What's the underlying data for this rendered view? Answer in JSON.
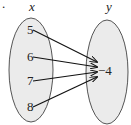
{
  "diagram": {
    "type": "mapping",
    "domain_label": "x",
    "range_label": "y",
    "domain_values": [
      "5",
      "6",
      "7",
      "8"
    ],
    "range_values": [
      "−4"
    ],
    "mappings": [
      {
        "from": "5",
        "to": "−4"
      },
      {
        "from": "6",
        "to": "−4"
      },
      {
        "from": "7",
        "to": "−4"
      },
      {
        "from": "8",
        "to": "−4"
      }
    ],
    "colors": {
      "ellipse_fill": "#ebebeb",
      "ellipse_stroke": "#555555",
      "arrow": "#111111"
    }
  }
}
